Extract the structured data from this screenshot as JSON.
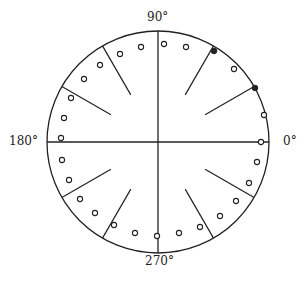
{
  "diagram": {
    "type": "polar-dial",
    "center": [
      158,
      142
    ],
    "radius": 111,
    "stroke_color": "#222222",
    "axis_labels": [
      {
        "text": "0°",
        "angle": 0,
        "x": 283,
        "y": 146
      },
      {
        "text": "90°",
        "angle": 90,
        "x": 148,
        "y": 22
      },
      {
        "text": "180°",
        "angle": 180,
        "x": 9,
        "y": 146
      },
      {
        "text": "270°",
        "angle": 270,
        "x": 146,
        "y": 266
      }
    ],
    "axes": [
      "horizontal",
      "vertical"
    ],
    "radial_ticks": {
      "angles": [
        30,
        60,
        120,
        150,
        210,
        240,
        300,
        330
      ],
      "inner_radius_fraction": 0.49
    },
    "open_markers": [
      [
        164,
        44
      ],
      [
        186,
        47
      ],
      [
        234,
        69
      ],
      [
        264,
        115
      ],
      [
        261,
        142
      ],
      [
        257,
        162
      ],
      [
        249,
        183
      ],
      [
        236,
        201
      ],
      [
        220,
        216
      ],
      [
        200,
        227
      ],
      [
        179,
        233
      ],
      [
        157,
        236
      ],
      [
        135,
        233
      ],
      [
        114,
        225
      ],
      [
        95,
        213
      ],
      [
        80,
        199
      ],
      [
        69,
        180
      ],
      [
        62,
        160
      ],
      [
        61,
        138
      ],
      [
        64,
        118
      ],
      [
        71,
        98
      ],
      [
        84,
        79
      ],
      [
        100,
        65
      ],
      [
        120,
        54
      ],
      [
        141,
        47
      ]
    ],
    "filled_markers": [
      [
        214,
        51
      ],
      [
        255,
        88
      ]
    ]
  }
}
